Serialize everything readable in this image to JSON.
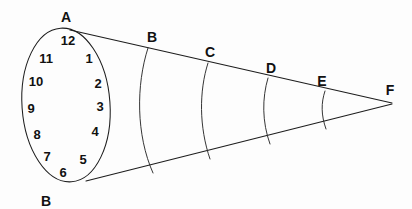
{
  "figure": {
    "background_color": "#fdfdfd",
    "line_color": "#1d1d1d",
    "text_color": "#111111",
    "width": 412,
    "height": 209
  },
  "clock_face": {
    "description": "Ellipse representing the circular base of the cone, marked like a clock dial",
    "numbers": [
      {
        "label": "12",
        "x": 68,
        "y": 40
      },
      {
        "label": "1",
        "x": 89,
        "y": 58
      },
      {
        "label": "2",
        "x": 98,
        "y": 83
      },
      {
        "label": "3",
        "x": 100,
        "y": 106
      },
      {
        "label": "4",
        "x": 95,
        "y": 131
      },
      {
        "label": "5",
        "x": 83,
        "y": 159
      },
      {
        "label": "6",
        "x": 63,
        "y": 172
      },
      {
        "label": "7",
        "x": 47,
        "y": 156
      },
      {
        "label": "8",
        "x": 37,
        "y": 134
      },
      {
        "label": "9",
        "x": 31,
        "y": 108
      },
      {
        "label": "10",
        "x": 36,
        "y": 81
      },
      {
        "label": "11",
        "x": 46,
        "y": 58
      }
    ]
  },
  "vertices": [
    {
      "label": "A",
      "x": 66,
      "y": 17
    },
    {
      "label": "B",
      "x": 152,
      "y": 37
    },
    {
      "label": "C",
      "x": 210,
      "y": 52
    },
    {
      "label": "D",
      "x": 271,
      "y": 68
    },
    {
      "label": "E",
      "x": 322,
      "y": 81
    },
    {
      "label": "F",
      "x": 390,
      "y": 90
    },
    {
      "label": "B",
      "x": 46,
      "y": 201
    }
  ],
  "cross_sections": {
    "description": "Curved arcs marking circular cross-sections of the cone at B, C, D and E",
    "count": 4,
    "labels": [
      "B",
      "C",
      "D",
      "E"
    ]
  },
  "apex": {
    "label": "F",
    "x": 392,
    "y": 103
  }
}
